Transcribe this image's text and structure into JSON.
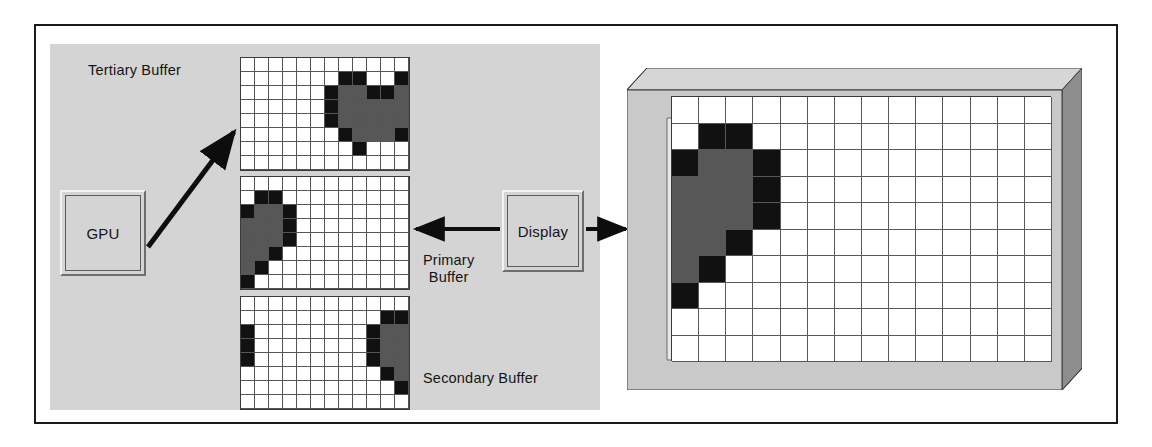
{
  "diagram": {
    "labels": {
      "tertiary_buffer": "Tertiary Buffer",
      "primary_buffer": "Primary\nBuffer",
      "secondary_buffer": "Secondary Buffer",
      "gpu": "GPU",
      "display": "Display"
    },
    "colors": {
      "panel_background": "#d4d4d4",
      "monitor_bezel": "#c9c9c9",
      "cell_white": "#ffffff",
      "cell_gray": "#575757",
      "cell_black": "#111111",
      "outline": "#1a1a1a"
    },
    "arrows": [
      {
        "name": "gpu-to-tertiary-arrow",
        "from": "GPU",
        "to": "Tertiary Buffer",
        "direction": "up-right"
      },
      {
        "name": "display-to-primary-arrow",
        "from": "Display",
        "to": "Primary Buffer",
        "direction": "left"
      },
      {
        "name": "display-to-monitor-arrow",
        "from": "Display",
        "to": "Monitor",
        "direction": "right"
      }
    ]
  },
  "buffers": {
    "columns": 12,
    "rows": 8,
    "cell_size": 14,
    "tertiary": {
      "name": "Tertiary Buffer",
      "grid": [
        [
          0,
          0,
          0,
          0,
          0,
          0,
          0,
          0,
          0,
          0,
          0,
          0
        ],
        [
          0,
          0,
          0,
          0,
          0,
          0,
          0,
          2,
          2,
          0,
          0,
          2
        ],
        [
          0,
          0,
          0,
          0,
          0,
          0,
          2,
          1,
          1,
          2,
          2,
          1
        ],
        [
          0,
          0,
          0,
          0,
          0,
          0,
          2,
          1,
          1,
          1,
          1,
          1
        ],
        [
          0,
          0,
          0,
          0,
          0,
          0,
          2,
          1,
          1,
          1,
          1,
          1
        ],
        [
          0,
          0,
          0,
          0,
          0,
          0,
          0,
          2,
          1,
          1,
          1,
          2
        ],
        [
          0,
          0,
          0,
          0,
          0,
          0,
          0,
          0,
          2,
          0,
          0,
          0
        ],
        [
          0,
          0,
          0,
          0,
          0,
          0,
          0,
          0,
          0,
          0,
          0,
          0
        ]
      ]
    },
    "primary": {
      "name": "Primary Buffer",
      "grid": [
        [
          0,
          0,
          0,
          0,
          0,
          0,
          0,
          0,
          0,
          0,
          0,
          0
        ],
        [
          0,
          2,
          2,
          0,
          0,
          0,
          0,
          0,
          0,
          0,
          0,
          0
        ],
        [
          2,
          1,
          1,
          2,
          0,
          0,
          0,
          0,
          0,
          0,
          0,
          0
        ],
        [
          1,
          1,
          1,
          2,
          0,
          0,
          0,
          0,
          0,
          0,
          0,
          0
        ],
        [
          1,
          1,
          1,
          2,
          0,
          0,
          0,
          0,
          0,
          0,
          0,
          0
        ],
        [
          1,
          1,
          2,
          0,
          0,
          0,
          0,
          0,
          0,
          0,
          0,
          0
        ],
        [
          1,
          2,
          0,
          0,
          0,
          0,
          0,
          0,
          0,
          0,
          0,
          0
        ],
        [
          2,
          0,
          0,
          0,
          0,
          0,
          0,
          0,
          0,
          0,
          0,
          0
        ]
      ]
    },
    "secondary": {
      "name": "Secondary Buffer",
      "grid": [
        [
          0,
          0,
          0,
          0,
          0,
          0,
          0,
          0,
          0,
          0,
          0,
          0
        ],
        [
          0,
          0,
          0,
          0,
          0,
          0,
          0,
          0,
          0,
          0,
          2,
          2
        ],
        [
          2,
          0,
          0,
          0,
          0,
          0,
          0,
          0,
          0,
          2,
          1,
          1
        ],
        [
          2,
          0,
          0,
          0,
          0,
          0,
          0,
          0,
          0,
          2,
          1,
          1
        ],
        [
          2,
          0,
          0,
          0,
          0,
          0,
          0,
          0,
          0,
          2,
          1,
          1
        ],
        [
          0,
          0,
          0,
          0,
          0,
          0,
          0,
          0,
          0,
          0,
          2,
          1
        ],
        [
          0,
          0,
          0,
          0,
          0,
          0,
          0,
          0,
          0,
          0,
          0,
          2
        ],
        [
          0,
          0,
          0,
          0,
          0,
          0,
          0,
          0,
          0,
          0,
          0,
          0
        ]
      ]
    }
  },
  "monitor": {
    "name": "Display monitor",
    "columns": 14,
    "rows": 10,
    "grid": [
      [
        0,
        0,
        0,
        0,
        0,
        0,
        0,
        0,
        0,
        0,
        0,
        0,
        0,
        0
      ],
      [
        0,
        2,
        2,
        0,
        0,
        0,
        0,
        0,
        0,
        0,
        0,
        0,
        0,
        0
      ],
      [
        2,
        1,
        1,
        2,
        0,
        0,
        0,
        0,
        0,
        0,
        0,
        0,
        0,
        0
      ],
      [
        1,
        1,
        1,
        2,
        0,
        0,
        0,
        0,
        0,
        0,
        0,
        0,
        0,
        0
      ],
      [
        1,
        1,
        1,
        2,
        0,
        0,
        0,
        0,
        0,
        0,
        0,
        0,
        0,
        0
      ],
      [
        1,
        1,
        2,
        0,
        0,
        0,
        0,
        0,
        0,
        0,
        0,
        0,
        0,
        0
      ],
      [
        1,
        2,
        0,
        0,
        0,
        0,
        0,
        0,
        0,
        0,
        0,
        0,
        0,
        0
      ],
      [
        2,
        0,
        0,
        0,
        0,
        0,
        0,
        0,
        0,
        0,
        0,
        0,
        0,
        0
      ],
      [
        0,
        0,
        0,
        0,
        0,
        0,
        0,
        0,
        0,
        0,
        0,
        0,
        0,
        0
      ],
      [
        0,
        0,
        0,
        0,
        0,
        0,
        0,
        0,
        0,
        0,
        0,
        0,
        0,
        0
      ]
    ]
  }
}
